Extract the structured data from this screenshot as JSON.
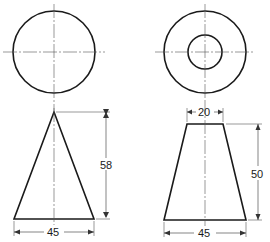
{
  "drawing": {
    "views": [
      {
        "name": "cone",
        "plan": {
          "shape": "circle",
          "center": [
            54,
            52
          ],
          "radius": 41
        },
        "elevation": {
          "shape": "triangle",
          "apex": [
            54,
            112
          ],
          "base_left": [
            14,
            219
          ],
          "base_right": [
            94,
            219
          ]
        },
        "dimensions": {
          "height": "58",
          "base": "45"
        }
      },
      {
        "name": "frustum",
        "plan": {
          "shape": "concentric-circles",
          "center": [
            205,
            52
          ],
          "outer_radius": 41,
          "inner_radius": 17
        },
        "elevation": {
          "shape": "trapezoid",
          "top_left": [
            187,
            124
          ],
          "top_right": [
            223,
            124
          ],
          "base_left": [
            164,
            220
          ],
          "base_right": [
            246,
            220
          ]
        },
        "dimensions": {
          "top": "20",
          "height": "50",
          "base": "45"
        }
      }
    ]
  }
}
